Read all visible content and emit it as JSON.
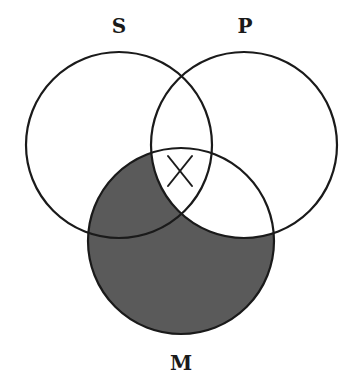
{
  "diagram": {
    "type": "venn",
    "title": "",
    "sets": [
      {
        "id": "S",
        "label": "S",
        "cx": 119,
        "cy": 145,
        "r": 93
      },
      {
        "id": "P",
        "label": "P",
        "cx": 244,
        "cy": 145,
        "r": 93
      },
      {
        "id": "M",
        "label": "M",
        "cx": 181,
        "cy": 241,
        "r": 93
      }
    ],
    "shaded_regions": [
      "S∩M∩¬P",
      "M∩¬S∩¬P"
    ],
    "shade_color": "#5a5a5a",
    "marked_regions": [
      {
        "region": "S∩P∩M",
        "mark": "X"
      }
    ],
    "labels": {
      "s": "S",
      "p": "P",
      "m": "M"
    }
  }
}
